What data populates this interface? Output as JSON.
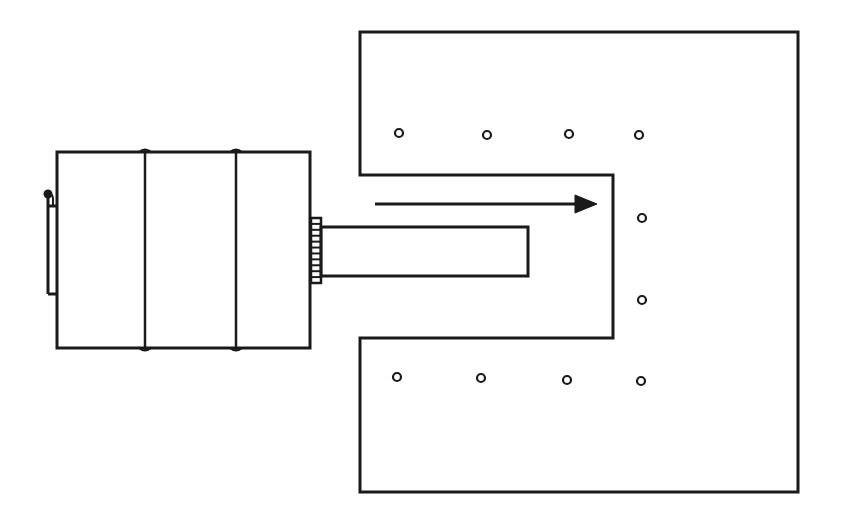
{
  "diagram": {
    "type": "mechanical line drawing",
    "colors": {
      "line": "#1a1a1a",
      "background": "#ffffff"
    },
    "components": {
      "drum": {
        "x": 57,
        "y": 152,
        "width": 253,
        "height": 196,
        "bands_x": [
          145,
          236
        ]
      },
      "handle": {
        "x": 48,
        "y1": 192,
        "y2": 294
      },
      "coupling": {
        "x": 311,
        "y": 218,
        "width": 10,
        "height": 65,
        "ridges": 11
      },
      "shaft": {
        "x": 321,
        "y": 227,
        "width": 207,
        "height": 49
      },
      "chamber": {
        "outer": {
          "x1": 360,
          "y1": 32,
          "x2": 798,
          "y2": 492
        },
        "notch": {
          "x1": 360,
          "y1": 175,
          "x2": 613,
          "y2": 338
        }
      },
      "arrow": {
        "x1": 375,
        "x2": 597,
        "y": 204,
        "direction": "right"
      },
      "holes": [
        {
          "x": 399,
          "y": 133
        },
        {
          "x": 487,
          "y": 135
        },
        {
          "x": 569,
          "y": 134
        },
        {
          "x": 639,
          "y": 135
        },
        {
          "x": 642,
          "y": 218
        },
        {
          "x": 642,
          "y": 300
        },
        {
          "x": 397,
          "y": 377
        },
        {
          "x": 481,
          "y": 378
        },
        {
          "x": 567,
          "y": 380
        },
        {
          "x": 641,
          "y": 381
        }
      ]
    }
  }
}
